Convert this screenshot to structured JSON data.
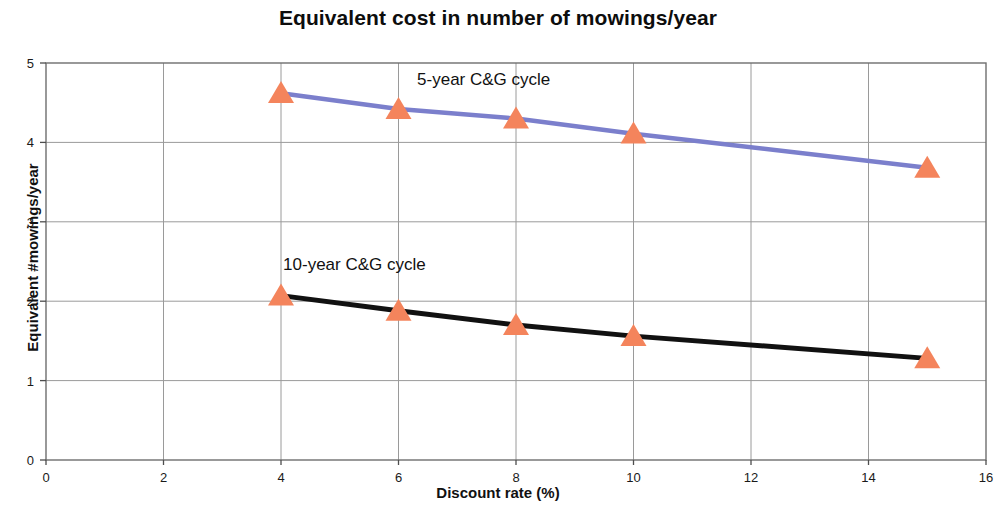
{
  "chart_data": {
    "type": "line",
    "title": "Equivalent cost in number of mowings/year",
    "xlabel": "Discount rate (%)",
    "ylabel": "Equivalent #mowings/year",
    "xlim": [
      0,
      16
    ],
    "ylim": [
      0,
      5
    ],
    "xticks": [
      "0",
      "2",
      "4",
      "6",
      "8",
      "10",
      "12",
      "14",
      "16"
    ],
    "xtick_values": [
      0,
      2,
      4,
      6,
      8,
      10,
      12,
      14,
      16
    ],
    "yticks": [
      "0",
      "1",
      "2",
      "3",
      "4",
      "5"
    ],
    "ytick_values": [
      0,
      1,
      2,
      3,
      4,
      5
    ],
    "grid": "horizontal-and-vertical",
    "legend": "inline-annotations",
    "marker": "triangle",
    "marker_color": "#F4845C",
    "x": [
      4,
      6,
      8,
      10,
      15
    ],
    "series": [
      {
        "name": "5-year C&G cycle",
        "label": "5-year C&G cycle",
        "color": "#7B7FCC",
        "values": [
          4.62,
          4.42,
          4.3,
          4.11,
          3.68
        ],
        "annotation_x": 7.45,
        "annotation_y": 4.72
      },
      {
        "name": "10-year C&G cycle",
        "label": "10-year C&G cycle",
        "color": "#111111",
        "values": [
          2.07,
          1.88,
          1.7,
          1.56,
          1.28
        ],
        "annotation_x": 5.25,
        "annotation_y": 2.39
      }
    ]
  }
}
